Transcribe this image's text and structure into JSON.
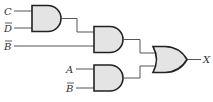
{
  "diagram": {
    "type": "logic-circuit",
    "inputs": {
      "c": "C",
      "d_not": "D",
      "b_not_1": "B",
      "a": "A",
      "b_not_2": "B"
    },
    "output": "X",
    "gates": [
      {
        "id": "and1",
        "type": "AND",
        "inputs": [
          "C",
          "D̄"
        ]
      },
      {
        "id": "and2",
        "type": "AND",
        "inputs": [
          "and1",
          "B̄"
        ]
      },
      {
        "id": "and3",
        "type": "AND",
        "inputs": [
          "A",
          "B̄"
        ]
      },
      {
        "id": "or1",
        "type": "OR",
        "inputs": [
          "and2",
          "and3"
        ],
        "output": "X"
      }
    ],
    "colors": {
      "gate_fill": "#e4e4e4",
      "gate_stroke": "#222222",
      "wire": "#555555"
    }
  }
}
